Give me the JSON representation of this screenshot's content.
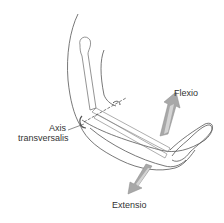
{
  "diagram": {
    "labels": {
      "axis_line1": "Axis",
      "axis_line2": "transversalis",
      "flexio": "Flexio",
      "extensio": "Extensio"
    },
    "colors": {
      "outline": "#555555",
      "arrow_fill": "#a8a8a8",
      "arrow_shade": "#d4d4d4",
      "text": "#333333",
      "background": "#ffffff"
    }
  }
}
